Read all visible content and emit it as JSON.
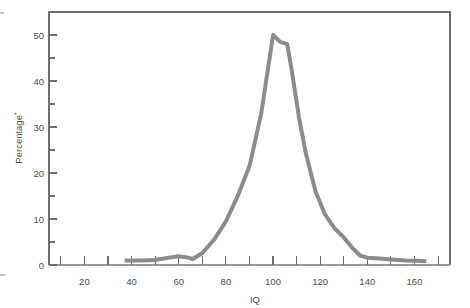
{
  "chart_data": {
    "type": "line",
    "title": "",
    "subtitle": "",
    "xlabel": "IQ",
    "ylabel": "Percentage",
    "ylabel_superscript": "*",
    "xlim": [
      5,
      175
    ],
    "ylim": [
      0,
      55
    ],
    "grid": false,
    "legend": null,
    "x_major_ticks": [
      20,
      40,
      60,
      80,
      100,
      120,
      140,
      160
    ],
    "x_minor_ticks": [
      10,
      30,
      50,
      70,
      90,
      110,
      130,
      150,
      170
    ],
    "x_tick_labels": [
      "20",
      "40",
      "60",
      "80",
      "100",
      "120",
      "140",
      "160"
    ],
    "y_major_ticks": [
      0,
      10,
      20,
      30,
      40,
      50
    ],
    "y_minor_ticks": [
      5,
      15,
      25,
      35,
      45
    ],
    "y_tick_labels": [
      "0",
      "10",
      "20",
      "30",
      "40",
      "50"
    ],
    "series": [
      {
        "name": "IQ distribution",
        "color": "#8c8c8c",
        "line_width": 4,
        "x": [
          37,
          44,
          50,
          56,
          60,
          63,
          66,
          70,
          75,
          80,
          85,
          90,
          95,
          100,
          103,
          106,
          108,
          111,
          114,
          118,
          122,
          126,
          130,
          134,
          137,
          140,
          145,
          150,
          156,
          161,
          165
        ],
        "values": [
          1.0,
          1.0,
          1.1,
          1.6,
          1.9,
          1.7,
          1.3,
          2.6,
          5.5,
          9.5,
          15.0,
          21.5,
          33.0,
          50.0,
          48.5,
          48.0,
          42.0,
          32.0,
          24.0,
          16.0,
          11.0,
          8.0,
          6.0,
          3.5,
          2.0,
          1.6,
          1.4,
          1.2,
          1.0,
          0.9,
          0.8
        ]
      }
    ]
  },
  "axes": {
    "y_axis_label_text": "Percentage",
    "y_axis_label_superscript": "*",
    "x_axis_label_text": "IQ"
  },
  "style": {
    "curve_color": "#8c8c8c",
    "axis_color": "#6e6e6e",
    "text_color": "#4d4d4d",
    "background": "#ffffff"
  },
  "margin_marks": {
    "top_left_tick": "",
    "bottom_left_tick": ""
  }
}
